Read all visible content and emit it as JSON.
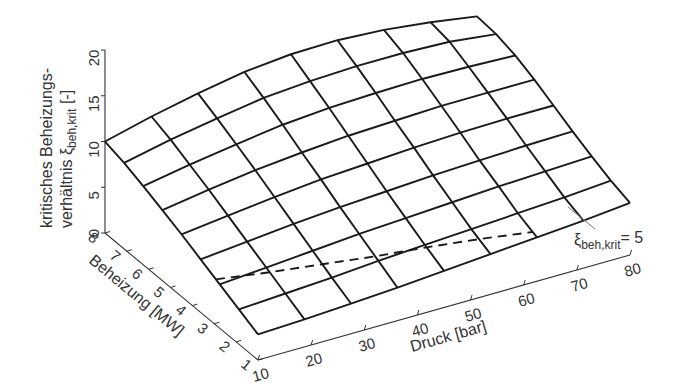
{
  "chart_data": {
    "type": "surface3d",
    "title": "",
    "xlabel": "Druck [bar]",
    "ylabel": "Beheizung [MW]",
    "zlabel_line1": "kritisches Beheizungs-",
    "zlabel_line2_prefix": "verhältnis ξ",
    "zlabel_line2_sub": "beh,krit",
    "zlabel_line2_suffix": " [-]",
    "x_ticks": [
      10,
      20,
      30,
      40,
      50,
      60,
      70,
      80
    ],
    "y_ticks": [
      1,
      2,
      3,
      4,
      5,
      6,
      7,
      8
    ],
    "z_ticks": [
      0,
      5,
      10,
      15,
      20
    ],
    "xlim": [
      10,
      80
    ],
    "ylim": [
      1,
      8
    ],
    "zlim": [
      0,
      20
    ],
    "grid_x": [
      10,
      18.75,
      27.5,
      36.25,
      45,
      53.75,
      62.5,
      71.25,
      80
    ],
    "grid_y": [
      1,
      1.875,
      2.75,
      3.625,
      4.5,
      5.375,
      6.25,
      7.125,
      8
    ],
    "z_values_rows_by_y": [
      [
        2.8,
        3.0,
        3.3,
        3.6,
        4.0,
        4.4,
        4.8,
        5.2,
        5.7
      ],
      [
        3.8,
        4.1,
        4.4,
        4.8,
        5.1,
        5.4,
        5.7,
        6.0,
        6.4
      ],
      [
        4.8,
        5.2,
        5.6,
        6.0,
        6.3,
        6.6,
        6.9,
        7.1,
        7.3
      ],
      [
        5.8,
        6.3,
        6.8,
        7.2,
        7.5,
        7.8,
        8.0,
        8.2,
        8.3
      ],
      [
        6.8,
        7.4,
        8.0,
        8.5,
        8.8,
        9.1,
        9.3,
        9.4,
        9.4
      ],
      [
        7.7,
        8.5,
        9.2,
        9.7,
        10.1,
        10.3,
        10.5,
        10.5,
        10.5
      ],
      [
        8.6,
        9.5,
        10.3,
        11.0,
        11.4,
        11.6,
        11.7,
        11.6,
        11.4
      ],
      [
        9.4,
        10.5,
        11.4,
        12.2,
        12.6,
        12.8,
        12.8,
        12.6,
        12.0
      ],
      [
        10.0,
        11.3,
        12.4,
        13.3,
        13.8,
        13.9,
        13.6,
        13.0,
        12.2
      ]
    ],
    "contour": {
      "label_prefix": "ξ",
      "label_sub": "beh,krit",
      "label_suffix": "= 5",
      "level": 5,
      "style": "dashed"
    },
    "grid": false,
    "legend": null
  }
}
